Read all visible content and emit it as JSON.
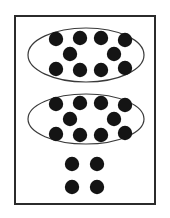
{
  "figure": {
    "total_count": "24",
    "tens_count": "2",
    "ones_count": "4",
    "canvas": {
      "width": 170,
      "height": 218
    },
    "background_color": "#ffffff",
    "border": {
      "label": "outer frame",
      "x": 14,
      "y": 15,
      "width": 142,
      "height": 190,
      "stroke_color": "#2b2b2b",
      "stroke_width": 2,
      "fill_color": "#ffffff"
    },
    "dot_style": {
      "fill_color": "#141414",
      "radius": 7.2
    },
    "oval_style": {
      "stroke_color": "#3a3a3a",
      "stroke_width": 1.2,
      "fill_color": "#ffffff"
    },
    "groups": [
      {
        "name": "group-of-ten-top",
        "label": "Group of ten (top oval)",
        "count": "10",
        "oval": {
          "cx": 86,
          "cy": 55,
          "rx": 58,
          "ry": 27
        },
        "dots": [
          {
            "cx": 56,
            "cy": 39
          },
          {
            "cx": 80,
            "cy": 38
          },
          {
            "cx": 101,
            "cy": 38
          },
          {
            "cx": 125,
            "cy": 40
          },
          {
            "cx": 70,
            "cy": 54
          },
          {
            "cx": 114,
            "cy": 54
          },
          {
            "cx": 56,
            "cy": 69
          },
          {
            "cx": 80,
            "cy": 70
          },
          {
            "cx": 101,
            "cy": 70
          },
          {
            "cx": 125,
            "cy": 68
          }
        ]
      },
      {
        "name": "group-of-ten-middle",
        "label": "Group of ten (middle oval)",
        "count": "10",
        "oval": {
          "cx": 86,
          "cy": 119,
          "rx": 58,
          "ry": 25
        },
        "dots": [
          {
            "cx": 56,
            "cy": 104
          },
          {
            "cx": 80,
            "cy": 103
          },
          {
            "cx": 101,
            "cy": 103
          },
          {
            "cx": 125,
            "cy": 105
          },
          {
            "cx": 70,
            "cy": 119
          },
          {
            "cx": 114,
            "cy": 119
          },
          {
            "cx": 56,
            "cy": 134
          },
          {
            "cx": 80,
            "cy": 135
          },
          {
            "cx": 101,
            "cy": 135
          },
          {
            "cx": 125,
            "cy": 133
          }
        ]
      },
      {
        "name": "loose-ones",
        "label": "Loose ones (ungrouped dots)",
        "count": "4",
        "oval": null,
        "dots": [
          {
            "cx": 72,
            "cy": 164
          },
          {
            "cx": 97,
            "cy": 164
          },
          {
            "cx": 72,
            "cy": 187
          },
          {
            "cx": 97,
            "cy": 187
          }
        ]
      }
    ]
  }
}
